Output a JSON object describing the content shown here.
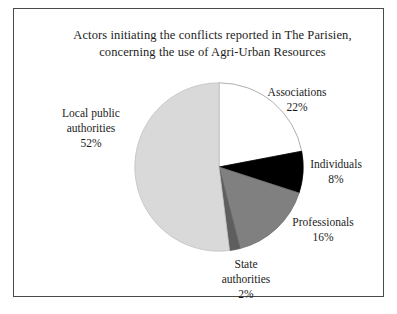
{
  "figure": {
    "title_line_1": "Actors initiating the conflicts reported in The Parisien,",
    "title_line_2": "concerning the use of Agri-Urban Resources",
    "frame_color": "#4a4a4a",
    "background_color": "#ffffff",
    "text_color": "#1c1c1c"
  },
  "chart_data": {
    "type": "pie",
    "title": "Actors initiating the conflicts reported in The Parisien, concerning the use of Agri-Urban Resources",
    "xlabel": "",
    "ylabel": "",
    "legend": "none",
    "grid": false,
    "start_angle_deg": 0,
    "direction": "clockwise",
    "units": "percent",
    "total": 100,
    "categories": [
      "Associations",
      "Individuals",
      "Professionals",
      "State authorities",
      "Local public authorities"
    ],
    "values": [
      22,
      8,
      16,
      2,
      52
    ],
    "colors": [
      "#ffffff",
      "#000000",
      "#808080",
      "#5e5e5e",
      "#d9d9d9"
    ],
    "slices": [
      {
        "label": "Associations",
        "value": 22,
        "value_text": "22%",
        "color": "#ffffff",
        "stroke": "#9a9a9a",
        "start_deg": 0,
        "end_deg": 79.2
      },
      {
        "label": "Individuals",
        "value": 8,
        "value_text": "8%",
        "color": "#000000",
        "stroke": "#000000",
        "start_deg": 79.2,
        "end_deg": 108.0
      },
      {
        "label": "Professionals",
        "value": 16,
        "value_text": "16%",
        "color": "#808080",
        "stroke": "#6e6e6e",
        "start_deg": 108.0,
        "end_deg": 165.6
      },
      {
        "label": "State authorities",
        "value": 2,
        "value_text": "2%",
        "color": "#5e5e5e",
        "stroke": "#5e5e5e",
        "start_deg": 165.6,
        "end_deg": 172.8
      },
      {
        "label": "Local public authorities",
        "value": 52,
        "value_text": "52%",
        "color": "#d9d9d9",
        "stroke": "#c2c2c2",
        "start_deg": 172.8,
        "end_deg": 360.0
      }
    ]
  },
  "labels": {
    "associations": {
      "name": "Associations",
      "value_text": "22%"
    },
    "individuals": {
      "name": "Individuals",
      "value_text": "8%"
    },
    "professionals": {
      "name": "Professionals",
      "value_text": "16%"
    },
    "state_authorities": {
      "name_line_1": "State",
      "name_line_2": "authorities",
      "value_text": "2%"
    },
    "local_public_authorities": {
      "name_line_1": "Local public",
      "name_line_2": "authorities",
      "value_text": "52%"
    }
  }
}
